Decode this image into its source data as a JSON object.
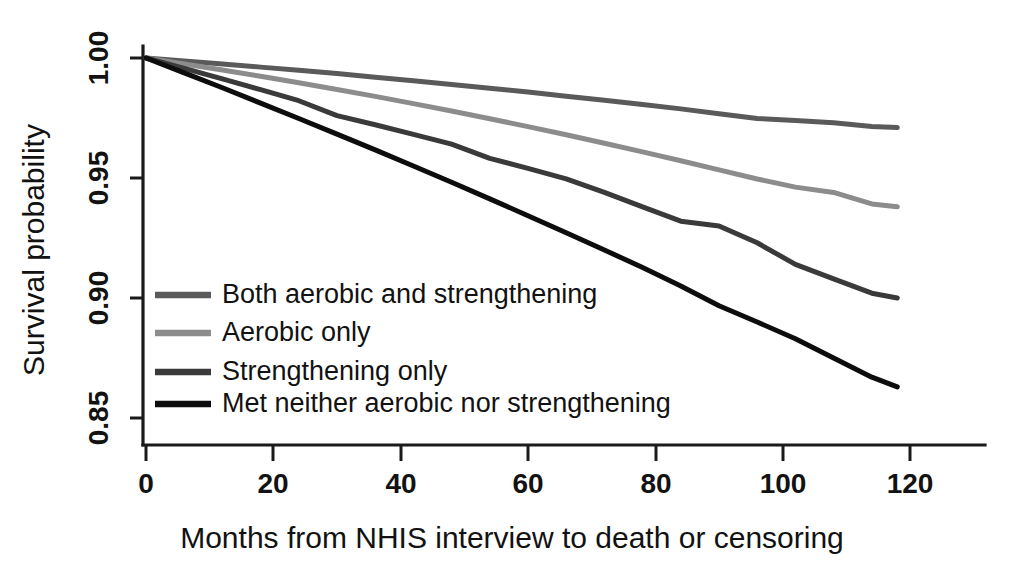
{
  "chart_data": {
    "type": "line",
    "title": "",
    "subtitle": "",
    "xlabel": "Months from NHIS interview to death or censoring",
    "ylabel": "Survival probability",
    "xlim": [
      0,
      124
    ],
    "ylim": [
      0.838,
      1.005
    ],
    "xticks": [
      0,
      20,
      40,
      60,
      80,
      100,
      120
    ],
    "xtick_labels": [
      "0",
      "20",
      "40",
      "60",
      "80",
      "100",
      "120"
    ],
    "yticks": [
      0.85,
      0.9,
      0.95,
      1.0
    ],
    "ytick_labels": [
      "0.85",
      "0.90",
      "0.95",
      "1.00"
    ],
    "grid": false,
    "legend_position": "inside-lower-left",
    "x": [
      0,
      6,
      12,
      18,
      24,
      30,
      36,
      42,
      48,
      54,
      60,
      66,
      72,
      78,
      84,
      90,
      96,
      102,
      108,
      114,
      118
    ],
    "series": [
      {
        "name": "Both aerobic and strengthening",
        "color": "#5a5a5a",
        "values": [
          1.0,
          0.9988,
          0.9975,
          0.9962,
          0.9949,
          0.9935,
          0.992,
          0.9905,
          0.989,
          0.9874,
          0.9858,
          0.9841,
          0.9824,
          0.9806,
          0.9788,
          0.9768,
          0.9748,
          0.974,
          0.973,
          0.9715,
          0.971
        ]
      },
      {
        "name": "Aerobic only",
        "color": "#8c8c8c",
        "values": [
          1.0,
          0.9975,
          0.995,
          0.9924,
          0.9897,
          0.9869,
          0.984,
          0.981,
          0.9779,
          0.9747,
          0.9714,
          0.968,
          0.9645,
          0.9609,
          0.9572,
          0.9534,
          0.9496,
          0.9462,
          0.944,
          0.9392,
          0.938
        ]
      },
      {
        "name": "Strengthening only",
        "color": "#3a3a3a",
        "values": [
          1.0,
          0.9957,
          0.9913,
          0.9868,
          0.9822,
          0.976,
          0.9722,
          0.9682,
          0.9641,
          0.9582,
          0.954,
          0.9496,
          0.944,
          0.938,
          0.932,
          0.93,
          0.923,
          0.914,
          0.908,
          0.902,
          0.9
        ]
      },
      {
        "name": "Met neither aerobic nor strengthening",
        "color": "#0d0d0d",
        "values": [
          1.0,
          0.9938,
          0.9876,
          0.9812,
          0.9748,
          0.9683,
          0.9617,
          0.955,
          0.9482,
          0.9413,
          0.9343,
          0.9272,
          0.92,
          0.9127,
          0.905,
          0.8968,
          0.89,
          0.883,
          0.875,
          0.867,
          0.863
        ]
      }
    ]
  },
  "legend": {
    "items": [
      {
        "label": "Both aerobic and strengthening",
        "color": "#5a5a5a"
      },
      {
        "label": "Aerobic only",
        "color": "#8c8c8c"
      },
      {
        "label": "Strengthening only",
        "color": "#3a3a3a"
      },
      {
        "label": "Met neither aerobic nor strengthening",
        "color": "#0d0d0d"
      }
    ]
  }
}
